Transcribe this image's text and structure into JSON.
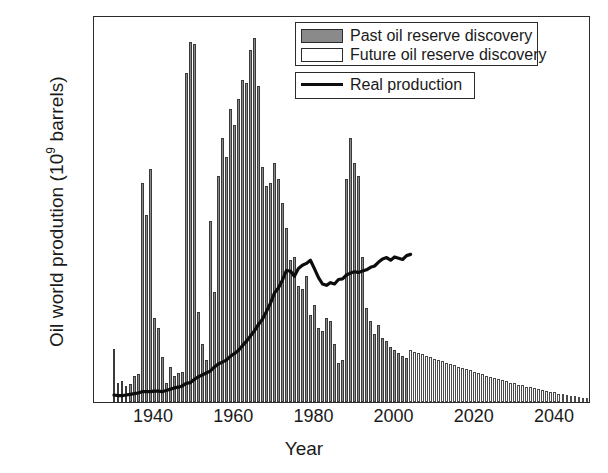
{
  "chart_data": {
    "type": "bar",
    "title": "",
    "xlabel": "Year",
    "ylabel": "Oil world prodution  (10⁹ barrels)",
    "ylabel_main": "Oil world prodution  (10",
    "ylabel_exp": "9",
    "ylabel_tail": " barrels)",
    "xlim": [
      1925,
      2049
    ],
    "ylim": [
      0,
      60
    ],
    "yticks": [
      0,
      10,
      20,
      30,
      40,
      50,
      60
    ],
    "ytick_labels": [
      "0",
      "10",
      "20",
      "30",
      "40",
      "50",
      "60"
    ],
    "yminor_step": 5,
    "xticks": [
      1940,
      1960,
      1980,
      2000,
      2020,
      2040
    ],
    "xtick_labels": [
      "1940",
      "1960",
      "1980",
      "2000",
      "2020",
      "2040"
    ],
    "xminor_step": 5,
    "grid": false,
    "legend_position": "upper-right",
    "colors": {
      "past_fill": "#8a8a8a",
      "past_edge": "#3a3a3a",
      "future_fill": "#fdfdfd",
      "future_edge": "#4a4a4a",
      "line": "#0d0d0d",
      "axis": "#2b2b2b",
      "background": "#ffffff"
    },
    "legend": [
      {
        "name": "Past oil reserve discovery",
        "marker": "filled-gray-rect"
      },
      {
        "name": "Future oil reserve discovery",
        "marker": "white-rect"
      },
      {
        "name": "Real production",
        "marker": "black-line"
      }
    ],
    "series": [
      {
        "name": "Past oil reserve discovery",
        "type": "bar",
        "x": [
          1930,
          1931,
          1932,
          1933,
          1934,
          1935,
          1936,
          1937,
          1938,
          1939,
          1940,
          1941,
          1942,
          1943,
          1944,
          1945,
          1946,
          1947,
          1948,
          1949,
          1950,
          1951,
          1952,
          1953,
          1954,
          1955,
          1956,
          1957,
          1958,
          1959,
          1960,
          1961,
          1962,
          1963,
          1964,
          1965,
          1966,
          1967,
          1968,
          1969,
          1970,
          1971,
          1972,
          1973,
          1974,
          1975,
          1976,
          1977,
          1978,
          1979,
          1980,
          1981,
          1982,
          1983,
          1984,
          1985,
          1986,
          1987,
          1988,
          1989,
          1990,
          1991,
          1992,
          1993,
          1994,
          1995,
          1996,
          1997,
          1998,
          1999,
          2000,
          2001,
          2002,
          2003
        ],
        "values": [
          8.2,
          3.0,
          3.3,
          2.5,
          2.8,
          4.0,
          4.4,
          34.0,
          29.0,
          36.2,
          13.0,
          11.5,
          7.0,
          3.0,
          5.5,
          4.0,
          4.5,
          4.6,
          51.0,
          55.8,
          55.5,
          14.0,
          9.0,
          6.5,
          28.0,
          17.0,
          35.0,
          41.0,
          38.0,
          45.5,
          43.0,
          47.0,
          50.0,
          49.5,
          54.5,
          56.5,
          49.0,
          36.5,
          33.5,
          34.0,
          37.0,
          34.5,
          30.8,
          27.0,
          22.0,
          22.5,
          18.0,
          17.5,
          19.5,
          13.5,
          15.0,
          11.5,
          11.0,
          13.0,
          12.5,
          9.0,
          6.0,
          6.5,
          34.5,
          41.0,
          37.0,
          35.0,
          22.5,
          14.5,
          12.5,
          10.5,
          12.0,
          10.0,
          9.5,
          8.5,
          8.0,
          7.6,
          7.2,
          6.8
        ]
      },
      {
        "name": "Future oil reserve discovery",
        "type": "bar",
        "x": [
          2004,
          2005,
          2006,
          2007,
          2008,
          2009,
          2010,
          2011,
          2012,
          2013,
          2014,
          2015,
          2016,
          2017,
          2018,
          2019,
          2020,
          2021,
          2022,
          2023,
          2024,
          2025,
          2026,
          2027,
          2028,
          2029,
          2030,
          2031,
          2032,
          2033,
          2034,
          2035,
          2036,
          2037,
          2038,
          2039,
          2040,
          2041,
          2042,
          2043,
          2044,
          2045,
          2046,
          2047,
          2048
        ],
        "values": [
          8.1,
          7.8,
          7.6,
          7.4,
          7.2,
          7.0,
          6.7,
          6.5,
          6.3,
          6.1,
          5.9,
          5.7,
          5.5,
          5.3,
          5.1,
          4.9,
          4.7,
          4.5,
          4.3,
          4.1,
          3.9,
          3.7,
          3.5,
          3.4,
          3.2,
          3.0,
          2.9,
          2.7,
          2.6,
          2.4,
          2.3,
          2.1,
          2.0,
          1.9,
          1.7,
          1.6,
          1.5,
          1.3,
          1.2,
          1.1,
          1.0,
          0.9,
          0.8,
          0.7,
          0.6
        ]
      },
      {
        "name": "Real production",
        "type": "line",
        "x": [
          1930,
          1931,
          1932,
          1933,
          1934,
          1935,
          1936,
          1937,
          1938,
          1939,
          1940,
          1941,
          1942,
          1943,
          1944,
          1945,
          1946,
          1947,
          1948,
          1949,
          1950,
          1951,
          1952,
          1953,
          1954,
          1955,
          1956,
          1957,
          1958,
          1959,
          1960,
          1961,
          1962,
          1963,
          1964,
          1965,
          1966,
          1967,
          1968,
          1969,
          1970,
          1971,
          1972,
          1973,
          1974,
          1975,
          1976,
          1977,
          1978,
          1979,
          1980,
          1981,
          1982,
          1983,
          1984,
          1985,
          1986,
          1987,
          1988,
          1989,
          1990,
          1991,
          1992,
          1993,
          1994,
          1995,
          1996,
          1997,
          1998,
          1999,
          2000,
          2001,
          2002,
          2003,
          2004
        ],
        "values": [
          1.4,
          1.3,
          1.3,
          1.4,
          1.5,
          1.6,
          1.7,
          1.9,
          1.9,
          1.9,
          2.0,
          2.0,
          1.9,
          2.1,
          2.3,
          2.5,
          2.6,
          2.8,
          3.2,
          3.3,
          3.8,
          4.2,
          4.5,
          4.8,
          5.1,
          5.7,
          6.2,
          6.5,
          6.8,
          7.4,
          7.8,
          8.3,
          9.0,
          9.7,
          10.5,
          11.3,
          12.3,
          13.1,
          14.3,
          15.6,
          17.2,
          18.0,
          19.2,
          20.7,
          20.6,
          19.8,
          21.0,
          21.5,
          21.8,
          22.3,
          21.0,
          19.6,
          18.6,
          18.4,
          18.8,
          18.6,
          19.3,
          19.4,
          20.0,
          20.3,
          20.5,
          20.4,
          20.6,
          20.8,
          21.2,
          21.4,
          22.0,
          22.5,
          22.7,
          22.3,
          22.8,
          22.6,
          22.4,
          23.0,
          23.2
        ]
      }
    ]
  }
}
